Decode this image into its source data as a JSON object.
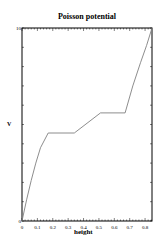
{
  "chart_data": {
    "type": "line",
    "title": "Poisson potential",
    "xlabel": "height",
    "ylabel": "V",
    "xlim": [
      0,
      0.845
    ],
    "ylim": [
      0,
      10
    ],
    "x_ticks": [
      "0",
      "0.1",
      "0.2",
      "0.3",
      "0.4",
      "0.5",
      "0.6",
      "0.7",
      "0.8"
    ],
    "y_ticks": [
      "0",
      "10"
    ],
    "grid": false,
    "legend": null,
    "series": [
      {
        "name": "V",
        "color": "#808080",
        "x": [
          0,
          0.03,
          0.06,
          0.09,
          0.12,
          0.17,
          0.34,
          0.51,
          0.67,
          0.72,
          0.77,
          0.81,
          0.845
        ],
        "values": [
          0,
          1.1,
          2.1,
          3.0,
          3.8,
          4.56,
          4.56,
          5.6,
          5.6,
          7.0,
          8.2,
          9.1,
          10
        ]
      }
    ]
  }
}
